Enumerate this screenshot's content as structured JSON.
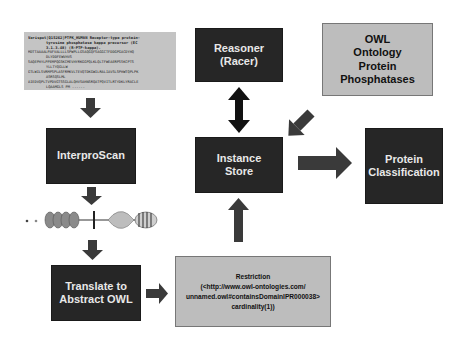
{
  "diagram": {
    "sequence_box": {
      "header": "Varispot|Q15262|PTPK_HUMAN Receptor-type protein-",
      "header_cont1": "tyrosine phosphatase kappa precursor (EC",
      "header_cont2": "3.1.3.48) (R-PTP-kappa).",
      "lines": [
        "MDTTAAAALPAFVALLLLSPWPLLGSAQGQFSAGGCTFDDGPGACDYHQ",
        "DLYDDFEWVHVS",
        "SAQEPHYLPPEMPQGSKCMEVHYRKGGPQLKLQLTFWEAERPSSKCPTS",
        "YLLTYQGLLW",
        "GTLWILSVRMPSPLASFRMKVLTEVQTDKGWILRALIAVSLSPHWTQPLPK",
        "ASRSQSLML",
        "AIEDVQPLTVPDVGTSSGLALQHVSAHNSRQATPQVITLRTYDKLYRACLE",
        "LQAAMGLS PM ......"
      ]
    },
    "nodes": {
      "interproscan": "InterproScan",
      "translate": [
        "Translate to",
        "Abstract OWL"
      ],
      "reasoner": [
        "Reasoner",
        "(Racer)"
      ],
      "owl_ontology": [
        "OWL",
        "Ontology",
        "Protein",
        "Phosphatases"
      ],
      "instance_store": [
        "Instance",
        "Store"
      ],
      "protein_classification": [
        "Protein",
        "Classification"
      ],
      "restriction": [
        "Restriction",
        "(<http://www.owl-ontologies.com/",
        "unnamed.owl#containsDomainIPR000038>",
        "cardinality(1))"
      ]
    },
    "domain_glyph": "protein-domain-architecture",
    "colors": {
      "dark_box": "#262626",
      "light_box": "#bdbdbd",
      "arrow": "#3a3a3a",
      "arrow_double": "#111111"
    }
  }
}
